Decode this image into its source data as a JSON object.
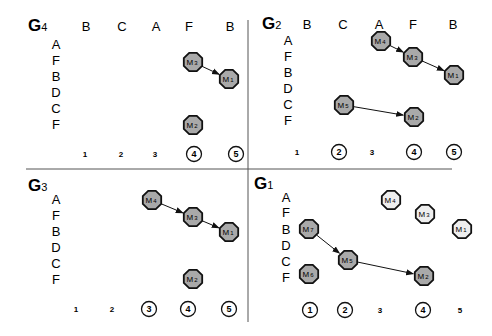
{
  "colors": {
    "node_fill": "#a9a9a9",
    "node_fill_light": "#eeeeee",
    "stroke": "#111111",
    "divider": "#555555"
  },
  "dividers": {
    "horizontal": {
      "x1": 26,
      "x2": 452,
      "y": 169
    },
    "vertical": {
      "x": 248,
      "y1": 20,
      "y2": 322
    }
  },
  "panels": [
    {
      "id": "G4",
      "title": "G",
      "subscript": "4",
      "title_pos": [
        28,
        31
      ],
      "col_headers": [
        {
          "label": "B",
          "x": 86
        },
        {
          "label": "C",
          "x": 122
        },
        {
          "label": "A",
          "x": 156
        },
        {
          "label": "F",
          "x": 189
        },
        {
          "label": "B",
          "x": 230
        }
      ],
      "col_header_y": 31,
      "row_labels": [
        "A",
        "F",
        "B",
        "D",
        "C",
        "F"
      ],
      "row_label_x": 56,
      "row_label_y": [
        49,
        65,
        81,
        97,
        113,
        129
      ],
      "steps": [
        {
          "label": "1",
          "x": 85,
          "circled": false
        },
        {
          "label": "2",
          "x": 121,
          "circled": false
        },
        {
          "label": "3",
          "x": 155,
          "circled": false
        },
        {
          "label": "4",
          "x": 194,
          "circled": true
        },
        {
          "label": "5",
          "x": 236,
          "circled": true
        }
      ],
      "steps_y": 154,
      "nodes": [
        {
          "id": "M3",
          "label": "M",
          "sub": "3",
          "x": 193,
          "y": 62,
          "shade": "dark"
        },
        {
          "id": "M1",
          "label": "M",
          "sub": "1",
          "x": 229,
          "y": 79,
          "shade": "dark"
        },
        {
          "id": "M2",
          "label": "M",
          "sub": "2",
          "x": 193,
          "y": 125,
          "shade": "dark"
        }
      ],
      "edges": [
        [
          "M3",
          "M1"
        ]
      ]
    },
    {
      "id": "G2",
      "title": "G",
      "subscript": "2",
      "title_pos": [
        262,
        29
      ],
      "col_headers": [
        {
          "label": "B",
          "x": 307
        },
        {
          "label": "C",
          "x": 343
        },
        {
          "label": "A",
          "x": 379
        },
        {
          "label": "F",
          "x": 413
        },
        {
          "label": "B",
          "x": 453
        }
      ],
      "col_header_y": 29,
      "row_labels": [
        "A",
        "F",
        "B",
        "D",
        "C",
        "F"
      ],
      "row_label_x": 288,
      "row_label_y": [
        45,
        61,
        77,
        93,
        109,
        125
      ],
      "steps": [
        {
          "label": "1",
          "x": 297,
          "circled": false
        },
        {
          "label": "2",
          "x": 339,
          "circled": true
        },
        {
          "label": "3",
          "x": 372,
          "circled": false
        },
        {
          "label": "4",
          "x": 414,
          "circled": true
        },
        {
          "label": "5",
          "x": 454,
          "circled": true
        }
      ],
      "steps_y": 152,
      "nodes": [
        {
          "id": "M4",
          "label": "M",
          "sub": "4",
          "x": 381,
          "y": 41,
          "shade": "dark"
        },
        {
          "id": "M3",
          "label": "M",
          "sub": "3",
          "x": 413,
          "y": 57,
          "shade": "dark"
        },
        {
          "id": "M1",
          "label": "M",
          "sub": "1",
          "x": 454,
          "y": 75,
          "shade": "dark"
        },
        {
          "id": "M5",
          "label": "M",
          "sub": "5",
          "x": 344,
          "y": 105,
          "shade": "dark"
        },
        {
          "id": "M2",
          "label": "M",
          "sub": "2",
          "x": 414,
          "y": 117,
          "shade": "dark"
        }
      ],
      "edges": [
        [
          "M4",
          "M3"
        ],
        [
          "M3",
          "M1"
        ],
        [
          "M5",
          "M2"
        ]
      ]
    },
    {
      "id": "G3",
      "title": "G",
      "subscript": "3",
      "title_pos": [
        28,
        191
      ],
      "col_headers": [],
      "col_header_y": 0,
      "row_labels": [
        "A",
        "F",
        "B",
        "D",
        "C",
        "F"
      ],
      "row_label_x": 56,
      "row_label_y": [
        204,
        220,
        236,
        252,
        268,
        284
      ],
      "steps": [
        {
          "label": "1",
          "x": 76,
          "circled": false
        },
        {
          "label": "2",
          "x": 112,
          "circled": false
        },
        {
          "label": "3",
          "x": 149,
          "circled": true
        },
        {
          "label": "4",
          "x": 188,
          "circled": true
        },
        {
          "label": "5",
          "x": 229,
          "circled": true
        }
      ],
      "steps_y": 309,
      "nodes": [
        {
          "id": "M4",
          "label": "M",
          "sub": "4",
          "x": 152,
          "y": 200,
          "shade": "dark"
        },
        {
          "id": "M3",
          "label": "M",
          "sub": "3",
          "x": 193,
          "y": 217,
          "shade": "dark"
        },
        {
          "id": "M1",
          "label": "M",
          "sub": "1",
          "x": 229,
          "y": 232,
          "shade": "dark"
        },
        {
          "id": "M2",
          "label": "M",
          "sub": "2",
          "x": 193,
          "y": 279,
          "shade": "dark"
        }
      ],
      "edges": [
        [
          "M4",
          "M3"
        ],
        [
          "M3",
          "M1"
        ]
      ]
    },
    {
      "id": "G1",
      "title": "G",
      "subscript": "1",
      "title_pos": [
        254,
        189
      ],
      "col_headers": [],
      "col_header_y": 0,
      "row_labels": [
        "A",
        "F",
        "B",
        "D",
        "C",
        "F"
      ],
      "row_label_x": 286,
      "row_label_y": [
        202,
        217,
        234,
        250,
        266,
        282
      ],
      "steps": [
        {
          "label": "1",
          "x": 310,
          "circled": true
        },
        {
          "label": "2",
          "x": 345,
          "circled": true
        },
        {
          "label": "3",
          "x": 380,
          "circled": false
        },
        {
          "label": "4",
          "x": 423,
          "circled": true
        },
        {
          "label": "5",
          "x": 460,
          "circled": false
        }
      ],
      "steps_y": 310,
      "nodes": [
        {
          "id": "M4",
          "label": "M",
          "sub": "4",
          "x": 391,
          "y": 200,
          "shade": "light"
        },
        {
          "id": "M3",
          "label": "M",
          "sub": "3",
          "x": 425,
          "y": 214,
          "shade": "light"
        },
        {
          "id": "M1",
          "label": "M",
          "sub": "1",
          "x": 462,
          "y": 229,
          "shade": "light"
        },
        {
          "id": "M7",
          "label": "M",
          "sub": "7",
          "x": 309,
          "y": 229,
          "shade": "dark"
        },
        {
          "id": "M5",
          "label": "M",
          "sub": "5",
          "x": 348,
          "y": 260,
          "shade": "dark"
        },
        {
          "id": "M6",
          "label": "M",
          "sub": "6",
          "x": 309,
          "y": 274,
          "shade": "dark"
        },
        {
          "id": "M2",
          "label": "M",
          "sub": "2",
          "x": 424,
          "y": 276,
          "shade": "dark"
        }
      ],
      "edges": [
        [
          "M7",
          "M5"
        ],
        [
          "M5",
          "M2"
        ]
      ]
    }
  ]
}
